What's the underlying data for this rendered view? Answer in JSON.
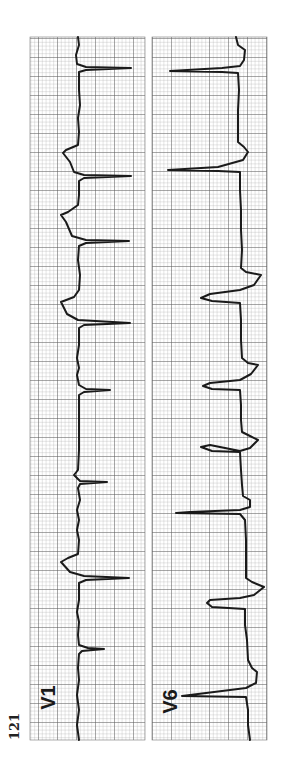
{
  "figure": {
    "number": "121",
    "paper_color": "#ffffff",
    "grid_minor_color": "#9a9a9a",
    "grid_major_color": "#555555",
    "trace_color": "#1a1a1a",
    "grid_small_px": 3.8,
    "grid_major_every": 5
  },
  "leads": [
    {
      "name": "V1",
      "label": "V1",
      "panel": {
        "x": 30,
        "y": 37,
        "w": 115,
        "h": 703
      },
      "label_pos": {
        "x": 36,
        "y": 686
      },
      "trace": [
        [
          78,
          37
        ],
        [
          79,
          45
        ],
        [
          76,
          55
        ],
        [
          77,
          64
        ],
        [
          86,
          67
        ],
        [
          131,
          68
        ],
        [
          86,
          70
        ],
        [
          79,
          72
        ],
        [
          79,
          90
        ],
        [
          80,
          105
        ],
        [
          78,
          118
        ],
        [
          79,
          132
        ],
        [
          78,
          145
        ],
        [
          66,
          150
        ],
        [
          63,
          153
        ],
        [
          70,
          162
        ],
        [
          74,
          172
        ],
        [
          84,
          175
        ],
        [
          131,
          176
        ],
        [
          84,
          178
        ],
        [
          79,
          181
        ],
        [
          79,
          195
        ],
        [
          78,
          205
        ],
        [
          68,
          212
        ],
        [
          61,
          215
        ],
        [
          66,
          222
        ],
        [
          72,
          236
        ],
        [
          86,
          240
        ],
        [
          129,
          241
        ],
        [
          86,
          243
        ],
        [
          79,
          246
        ],
        [
          78,
          260
        ],
        [
          80,
          275
        ],
        [
          79,
          290
        ],
        [
          74,
          297
        ],
        [
          61,
          302
        ],
        [
          67,
          314
        ],
        [
          78,
          320
        ],
        [
          130,
          323
        ],
        [
          84,
          325
        ],
        [
          79,
          328
        ],
        [
          79,
          345
        ],
        [
          77,
          358
        ],
        [
          79,
          368
        ],
        [
          77,
          375
        ],
        [
          79,
          385
        ],
        [
          86,
          389
        ],
        [
          110,
          390
        ],
        [
          84,
          392
        ],
        [
          79,
          395
        ],
        [
          79,
          420
        ],
        [
          79,
          450
        ],
        [
          78,
          470
        ],
        [
          74,
          475
        ],
        [
          80,
          481
        ],
        [
          107,
          482
        ],
        [
          80,
          484
        ],
        [
          78,
          488
        ],
        [
          80,
          500
        ],
        [
          77,
          510
        ],
        [
          79,
          520
        ],
        [
          77,
          530
        ],
        [
          79,
          540
        ],
        [
          78,
          554
        ],
        [
          68,
          558
        ],
        [
          61,
          562
        ],
        [
          70,
          572
        ],
        [
          84,
          576
        ],
        [
          129,
          578
        ],
        [
          86,
          580
        ],
        [
          79,
          583
        ],
        [
          79,
          600
        ],
        [
          77,
          612
        ],
        [
          79,
          622
        ],
        [
          78,
          635
        ],
        [
          79,
          645
        ],
        [
          88,
          648
        ],
        [
          104,
          649
        ],
        [
          82,
          651
        ],
        [
          79,
          654
        ],
        [
          78,
          668
        ],
        [
          79,
          680
        ],
        [
          77,
          695
        ],
        [
          79,
          710
        ],
        [
          77,
          725
        ],
        [
          79,
          740
        ]
      ]
    },
    {
      "name": "V6",
      "label": "V6",
      "panel": {
        "x": 152,
        "y": 37,
        "w": 115,
        "h": 703
      },
      "label_pos": {
        "x": 160,
        "y": 690
      },
      "trace": [
        [
          236,
          37
        ],
        [
          238,
          45
        ],
        [
          245,
          50
        ],
        [
          244,
          60
        ],
        [
          240,
          66
        ],
        [
          222,
          68
        ],
        [
          170,
          71
        ],
        [
          222,
          72
        ],
        [
          238,
          73
        ],
        [
          239,
          90
        ],
        [
          238,
          110
        ],
        [
          238,
          130
        ],
        [
          238,
          142
        ],
        [
          244,
          147
        ],
        [
          248,
          152
        ],
        [
          243,
          160
        ],
        [
          218,
          167
        ],
        [
          168,
          170
        ],
        [
          218,
          171
        ],
        [
          240,
          172
        ],
        [
          240,
          190
        ],
        [
          241,
          210
        ],
        [
          241,
          230
        ],
        [
          242,
          250
        ],
        [
          241,
          268
        ],
        [
          246,
          272
        ],
        [
          261,
          275
        ],
        [
          254,
          285
        ],
        [
          240,
          290
        ],
        [
          210,
          294
        ],
        [
          201,
          298
        ],
        [
          212,
          301
        ],
        [
          240,
          303
        ],
        [
          241,
          320
        ],
        [
          241,
          340
        ],
        [
          242,
          358
        ],
        [
          248,
          363
        ],
        [
          258,
          365
        ],
        [
          251,
          374
        ],
        [
          240,
          380
        ],
        [
          210,
          383
        ],
        [
          203,
          386
        ],
        [
          212,
          389
        ],
        [
          240,
          390
        ],
        [
          241,
          405
        ],
        [
          241,
          420
        ],
        [
          242,
          432
        ],
        [
          250,
          436
        ],
        [
          258,
          440
        ],
        [
          250,
          448
        ],
        [
          240,
          451
        ],
        [
          210,
          445
        ],
        [
          201,
          447
        ],
        [
          212,
          451
        ],
        [
          240,
          452
        ],
        [
          241,
          470
        ],
        [
          242,
          485
        ],
        [
          243,
          496
        ],
        [
          250,
          500
        ],
        [
          250,
          507
        ],
        [
          240,
          510
        ],
        [
          190,
          512
        ],
        [
          176,
          513
        ],
        [
          240,
          514
        ],
        [
          245,
          520
        ],
        [
          246,
          540
        ],
        [
          246,
          560
        ],
        [
          246,
          578
        ],
        [
          252,
          582
        ],
        [
          264,
          587
        ],
        [
          254,
          595
        ],
        [
          240,
          598
        ],
        [
          210,
          600
        ],
        [
          207,
          603
        ],
        [
          212,
          607
        ],
        [
          245,
          609
        ],
        [
          245,
          625
        ],
        [
          247,
          640
        ],
        [
          248,
          660
        ],
        [
          252,
          668
        ],
        [
          257,
          672
        ],
        [
          256,
          683
        ],
        [
          246,
          688
        ],
        [
          182,
          696
        ],
        [
          246,
          697
        ],
        [
          248,
          710
        ],
        [
          248,
          725
        ],
        [
          250,
          740
        ]
      ]
    }
  ]
}
